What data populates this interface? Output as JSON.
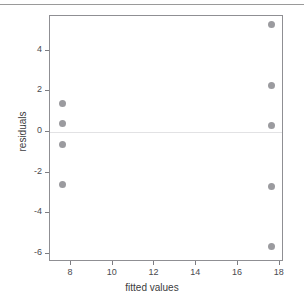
{
  "chart_data": {
    "type": "scatter",
    "title": "",
    "xlabel": "fitted values",
    "ylabel": "residuals",
    "xlim": [
      7.0,
      18.2
    ],
    "ylim": [
      -6.4,
      5.7
    ],
    "xticks": [
      8,
      10,
      12,
      14,
      16,
      18
    ],
    "yticks": [
      4,
      2,
      0,
      -2,
      -4,
      -6
    ],
    "xticklabels": [
      "8",
      "10",
      "12",
      "14",
      "16",
      "18"
    ],
    "yticklabels": [
      "4",
      "2",
      "0",
      "-2",
      "-4",
      "-6"
    ],
    "grid": false,
    "legend": null,
    "reference_lines": [
      {
        "name": "zero-line",
        "orientation": "horizontal",
        "y": 0,
        "color": "#e2e2e4"
      }
    ],
    "marker": {
      "shape": "circle",
      "color": "#9b9b9f",
      "size_px": 7
    },
    "points": [
      {
        "x": 7.6,
        "y": 1.4
      },
      {
        "x": 7.6,
        "y": 0.4
      },
      {
        "x": 7.6,
        "y": -0.6
      },
      {
        "x": 7.6,
        "y": -2.6
      },
      {
        "x": 17.6,
        "y": 5.3
      },
      {
        "x": 17.6,
        "y": 2.3
      },
      {
        "x": 17.6,
        "y": 0.3
      },
      {
        "x": 17.6,
        "y": -2.7
      },
      {
        "x": 17.6,
        "y": -5.65
      }
    ]
  },
  "figure": {
    "background_color": "#ffffff",
    "frame_color": "#8f8f93",
    "top_rule_color": "#9a9a9a"
  }
}
